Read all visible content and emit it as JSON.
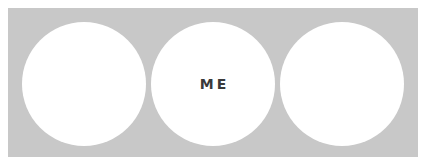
{
  "panel": {
    "background": "#c8c8c8"
  },
  "circles": [
    {
      "label": ""
    },
    {
      "label": "ME"
    },
    {
      "label": ""
    }
  ]
}
